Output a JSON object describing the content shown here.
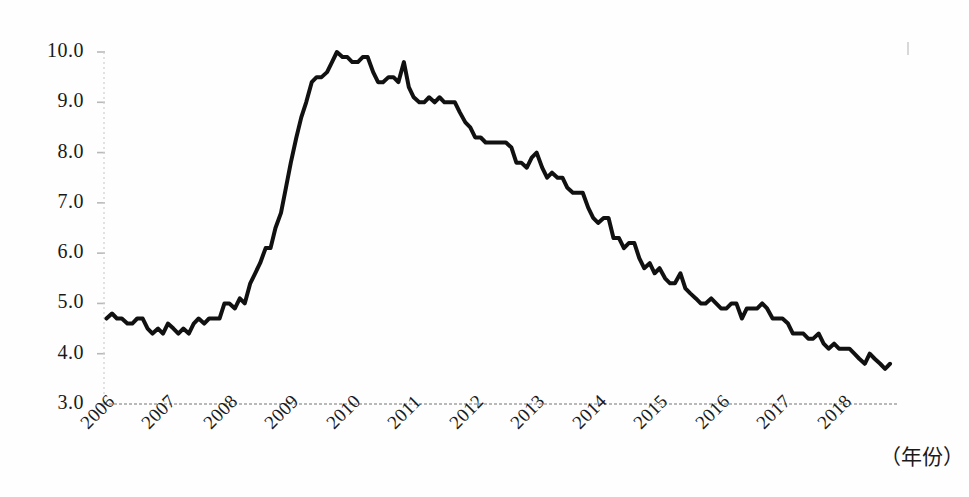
{
  "figure": {
    "title": "",
    "xaxis_title": "（年份）",
    "line_color": "#111111",
    "axis_color": "#b9b9b9",
    "background": "#fefefe"
  },
  "axes": {
    "y_ticks": [
      "3.0",
      "4.0",
      "5.0",
      "6.0",
      "7.0",
      "8.0",
      "9.0",
      "10.0"
    ],
    "x_ticks": [
      "2006",
      "2007",
      "2008",
      "2009",
      "2010",
      "2011",
      "2012",
      "2013",
      "2014",
      "2015",
      "2016",
      "2017",
      "2018"
    ]
  },
  "chart_data": {
    "type": "line",
    "title": "",
    "xlabel": "（年份）",
    "ylabel": "",
    "xlim": [
      2006.0,
      2018.92
    ],
    "ylim": [
      3.0,
      10.0
    ],
    "grid": false,
    "legend": null,
    "x_tick_labels": [
      "2006",
      "2007",
      "2008",
      "2009",
      "2010",
      "2011",
      "2012",
      "2013",
      "2014",
      "2015",
      "2016",
      "2017",
      "2018"
    ],
    "x_tick_values": [
      2006,
      2007,
      2008,
      2009,
      2010,
      2011,
      2012,
      2013,
      2014,
      2015,
      2016,
      2017,
      2018
    ],
    "y_tick_labels": [
      "3.0",
      "4.0",
      "5.0",
      "6.0",
      "7.0",
      "8.0",
      "9.0",
      "10.0"
    ],
    "y_tick_values": [
      3.0,
      4.0,
      5.0,
      6.0,
      7.0,
      8.0,
      9.0,
      10.0
    ],
    "series": [
      {
        "name": "unemployment-rate",
        "color": "#111111",
        "line_width": 4,
        "x": [
          2006.04,
          2006.13,
          2006.21,
          2006.29,
          2006.38,
          2006.46,
          2006.54,
          2006.63,
          2006.71,
          2006.79,
          2006.88,
          2006.96,
          2007.04,
          2007.13,
          2007.21,
          2007.29,
          2007.38,
          2007.46,
          2007.54,
          2007.63,
          2007.71,
          2007.79,
          2007.88,
          2007.96,
          2008.04,
          2008.13,
          2008.21,
          2008.29,
          2008.38,
          2008.46,
          2008.54,
          2008.63,
          2008.71,
          2008.79,
          2008.88,
          2008.96,
          2009.04,
          2009.13,
          2009.21,
          2009.29,
          2009.38,
          2009.46,
          2009.54,
          2009.63,
          2009.71,
          2009.79,
          2009.88,
          2009.96,
          2010.04,
          2010.13,
          2010.21,
          2010.29,
          2010.38,
          2010.46,
          2010.54,
          2010.63,
          2010.71,
          2010.79,
          2010.88,
          2010.96,
          2011.04,
          2011.13,
          2011.21,
          2011.29,
          2011.38,
          2011.46,
          2011.54,
          2011.63,
          2011.71,
          2011.79,
          2011.88,
          2011.96,
          2012.04,
          2012.13,
          2012.21,
          2012.29,
          2012.38,
          2012.46,
          2012.54,
          2012.63,
          2012.71,
          2012.79,
          2012.88,
          2012.96,
          2013.04,
          2013.13,
          2013.21,
          2013.29,
          2013.38,
          2013.46,
          2013.54,
          2013.63,
          2013.71,
          2013.79,
          2013.88,
          2013.96,
          2014.04,
          2014.13,
          2014.21,
          2014.29,
          2014.38,
          2014.46,
          2014.54,
          2014.63,
          2014.71,
          2014.79,
          2014.88,
          2014.96,
          2015.04,
          2015.13,
          2015.21,
          2015.29,
          2015.38,
          2015.46,
          2015.54,
          2015.63,
          2015.71,
          2015.79,
          2015.88,
          2015.96,
          2016.04,
          2016.13,
          2016.21,
          2016.29,
          2016.38,
          2016.46,
          2016.54,
          2016.63,
          2016.71,
          2016.79,
          2016.88,
          2016.96,
          2017.04,
          2017.13,
          2017.21,
          2017.29,
          2017.38,
          2017.46,
          2017.54,
          2017.63,
          2017.71,
          2017.79,
          2017.88,
          2017.96,
          2018.04,
          2018.13,
          2018.21,
          2018.29,
          2018.38,
          2018.46,
          2018.54,
          2018.63,
          2018.71,
          2018.79
        ],
        "values": [
          4.7,
          4.8,
          4.7,
          4.7,
          4.6,
          4.6,
          4.7,
          4.7,
          4.5,
          4.4,
          4.5,
          4.4,
          4.6,
          4.5,
          4.4,
          4.5,
          4.4,
          4.6,
          4.7,
          4.6,
          4.7,
          4.7,
          4.7,
          5.0,
          5.0,
          4.9,
          5.1,
          5.0,
          5.4,
          5.6,
          5.8,
          6.1,
          6.1,
          6.5,
          6.8,
          7.3,
          7.8,
          8.3,
          8.7,
          9.0,
          9.4,
          9.5,
          9.5,
          9.6,
          9.8,
          10.0,
          9.9,
          9.9,
          9.8,
          9.8,
          9.9,
          9.9,
          9.6,
          9.4,
          9.4,
          9.5,
          9.5,
          9.4,
          9.8,
          9.3,
          9.1,
          9.0,
          9.0,
          9.1,
          9.0,
          9.1,
          9.0,
          9.0,
          9.0,
          8.8,
          8.6,
          8.5,
          8.3,
          8.3,
          8.2,
          8.2,
          8.2,
          8.2,
          8.2,
          8.1,
          7.8,
          7.8,
          7.7,
          7.9,
          8.0,
          7.7,
          7.5,
          7.6,
          7.5,
          7.5,
          7.3,
          7.2,
          7.2,
          7.2,
          6.9,
          6.7,
          6.6,
          6.7,
          6.7,
          6.3,
          6.3,
          6.1,
          6.2,
          6.2,
          5.9,
          5.7,
          5.8,
          5.6,
          5.7,
          5.5,
          5.4,
          5.4,
          5.6,
          5.3,
          5.2,
          5.1,
          5.0,
          5.0,
          5.1,
          5.0,
          4.9,
          4.9,
          5.0,
          5.0,
          4.7,
          4.9,
          4.9,
          4.9,
          5.0,
          4.9,
          4.7,
          4.7,
          4.7,
          4.6,
          4.4,
          4.4,
          4.4,
          4.3,
          4.3,
          4.4,
          4.2,
          4.1,
          4.2,
          4.1,
          4.1,
          4.1,
          4.0,
          3.9,
          3.8,
          4.0,
          3.9,
          3.8,
          3.7,
          3.8
        ]
      }
    ]
  }
}
